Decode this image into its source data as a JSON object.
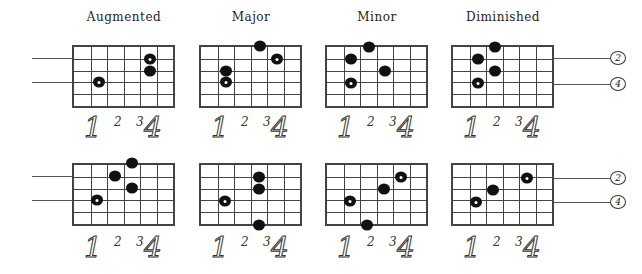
{
  "titles": [
    "Augmented",
    "Major",
    "Minor",
    "Diminished"
  ],
  "finger_labels": [
    "1",
    "2",
    "3",
    "4"
  ],
  "string_markers": [
    "2",
    "4"
  ],
  "colors": {
    "ink": "#111111",
    "grid": "#444444",
    "background": "#ffffff"
  },
  "grid": {
    "columns": 6,
    "lines": 6
  },
  "diagrams": [
    {
      "row": "top",
      "name": "Augmented",
      "x": 72,
      "y": 45,
      "dots": [
        {
          "x": 99,
          "y": 82,
          "open": true
        },
        {
          "x": 150,
          "y": 59,
          "open": true
        },
        {
          "x": 150,
          "y": 71,
          "open": false
        }
      ]
    },
    {
      "row": "top",
      "name": "Major",
      "x": 199,
      "y": 45,
      "dots": [
        {
          "x": 260,
          "y": 46,
          "open": false
        },
        {
          "x": 277,
          "y": 59,
          "open": true
        },
        {
          "x": 226,
          "y": 71,
          "open": false
        },
        {
          "x": 226,
          "y": 82,
          "open": true
        }
      ]
    },
    {
      "row": "top",
      "name": "Minor",
      "x": 325,
      "y": 45,
      "dots": [
        {
          "x": 369,
          "y": 47,
          "open": false
        },
        {
          "x": 351,
          "y": 59,
          "open": false
        },
        {
          "x": 385,
          "y": 71,
          "open": false
        },
        {
          "x": 351,
          "y": 83,
          "open": true
        }
      ]
    },
    {
      "row": "top",
      "name": "Diminished",
      "x": 451,
      "y": 45,
      "dots": [
        {
          "x": 495,
          "y": 47,
          "open": false
        },
        {
          "x": 478,
          "y": 59,
          "open": false
        },
        {
          "x": 495,
          "y": 71,
          "open": false
        },
        {
          "x": 478,
          "y": 83,
          "open": true
        }
      ]
    },
    {
      "row": "bottom",
      "name": "Augmented",
      "x": 72,
      "y": 163,
      "dots": [
        {
          "x": 132,
          "y": 163,
          "open": false
        },
        {
          "x": 115,
          "y": 176,
          "open": false
        },
        {
          "x": 132,
          "y": 188,
          "open": false
        },
        {
          "x": 97,
          "y": 200,
          "open": true
        }
      ]
    },
    {
      "row": "bottom",
      "name": "Major",
      "x": 199,
      "y": 163,
      "dots": [
        {
          "x": 259,
          "y": 177,
          "open": false
        },
        {
          "x": 259,
          "y": 189,
          "open": false
        },
        {
          "x": 225,
          "y": 201,
          "open": true
        },
        {
          "x": 259,
          "y": 225,
          "open": false
        }
      ]
    },
    {
      "row": "bottom",
      "name": "Minor",
      "x": 325,
      "y": 163,
      "dots": [
        {
          "x": 401,
          "y": 177,
          "open": true
        },
        {
          "x": 384,
          "y": 189,
          "open": false
        },
        {
          "x": 350,
          "y": 201,
          "open": true
        },
        {
          "x": 367,
          "y": 225,
          "open": false
        }
      ]
    },
    {
      "row": "bottom",
      "name": "Diminished",
      "x": 451,
      "y": 163,
      "dots": [
        {
          "x": 527,
          "y": 178,
          "open": true
        },
        {
          "x": 493,
          "y": 190,
          "open": false
        },
        {
          "x": 476,
          "y": 202,
          "open": true
        }
      ]
    }
  ]
}
